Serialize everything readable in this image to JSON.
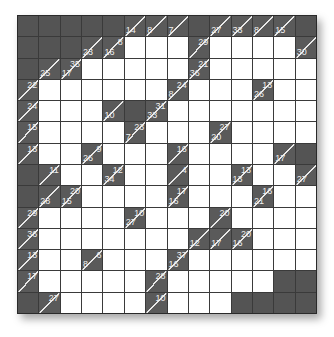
{
  "puzzle": {
    "type": "kakuro",
    "rows": 14,
    "cols": 14,
    "colors": {
      "clue_bg": "#5a5a5a",
      "black_bg": "#545454",
      "white_bg": "#ffffff",
      "grid_line": "#3a3a3a",
      "clue_text": "#f0f0f0"
    },
    "grid": [
      [
        "B",
        "B",
        "B",
        "B",
        "B",
        {
          "d": "14"
        },
        {
          "d": "8"
        },
        {
          "d": "7"
        },
        "B",
        {
          "d": "27"
        },
        {
          "d": "33"
        },
        {
          "d": "8"
        },
        {
          "d": "15"
        },
        "B"
      ],
      [
        "B",
        "B",
        "B",
        {
          "d": "23"
        },
        {
          "d": "16",
          "r": "8"
        },
        "W",
        "W",
        "W",
        {
          "r": "29"
        },
        "W",
        "W",
        "W",
        "W",
        {
          "d": "30"
        }
      ],
      [
        "B",
        {
          "d": "25"
        },
        {
          "d": "17",
          "r": "35"
        },
        "W",
        "W",
        "W",
        "W",
        "W",
        {
          "d": "36",
          "r": "21"
        },
        "W",
        "W",
        "W",
        "W",
        "W"
      ],
      [
        {
          "r": "22"
        },
        "W",
        "W",
        "W",
        "W",
        "W",
        "W",
        {
          "d": "8",
          "r": "24"
        },
        "W",
        "W",
        "W",
        {
          "d": "26",
          "r": "13"
        },
        "W",
        "W"
      ],
      [
        {
          "r": "24"
        },
        "W",
        "W",
        "W",
        {
          "d": "10"
        },
        "B",
        {
          "d": "33",
          "r": "31"
        },
        "W",
        "W",
        "W",
        "W",
        "W",
        "W",
        "W"
      ],
      [
        {
          "r": "15"
        },
        "W",
        "W",
        "W",
        "W",
        {
          "d": "7",
          "r": "23"
        },
        "W",
        "W",
        "W",
        {
          "d": "20",
          "r": "27"
        },
        "W",
        "W",
        "W",
        "W"
      ],
      [
        {
          "r": "13"
        },
        "W",
        "W",
        {
          "d": "26",
          "r": "9"
        },
        "W",
        "W",
        "W",
        {
          "r": "16"
        },
        "W",
        "W",
        "W",
        "W",
        {
          "d": "17"
        },
        "B"
      ],
      [
        "B",
        {
          "r": "11"
        },
        "W",
        "W",
        {
          "d": "34",
          "r": "12"
        },
        "W",
        "W",
        {
          "r": "4"
        },
        "W",
        "W",
        {
          "d": "13",
          "r": "13"
        },
        "W",
        "W",
        {
          "d": "27"
        }
      ],
      [
        "B",
        {
          "d": "28"
        },
        {
          "d": "15",
          "r": "20"
        },
        "W",
        "W",
        "W",
        "W",
        {
          "d": "16",
          "r": "17"
        },
        "W",
        "W",
        "W",
        {
          "d": "21",
          "r": "16"
        },
        "W",
        "W"
      ],
      [
        {
          "r": "29"
        },
        "W",
        "W",
        "W",
        "W",
        {
          "d": "27",
          "r": "10"
        },
        "W",
        "W",
        "W",
        {
          "r": "20"
        },
        "W",
        "W",
        "W",
        "W"
      ],
      [
        {
          "r": "36"
        },
        "W",
        "W",
        "W",
        "W",
        "W",
        "W",
        "W",
        {
          "d": "12"
        },
        {
          "d": "17"
        },
        {
          "d": "16",
          "r": "20"
        },
        "W",
        "W",
        "W"
      ],
      [
        {
          "r": "13"
        },
        "W",
        "W",
        {
          "d": "8",
          "r": "6"
        },
        "W",
        "W",
        "W",
        {
          "d": "16",
          "r": "37"
        },
        "W",
        "W",
        "W",
        "W",
        "W",
        "W"
      ],
      [
        {
          "r": "17"
        },
        "W",
        "W",
        "W",
        "W",
        "W",
        {
          "r": "28"
        },
        "W",
        "W",
        "W",
        "W",
        "W",
        "B",
        "B"
      ],
      [
        "B",
        {
          "r": "27"
        },
        "W",
        "W",
        "W",
        "W",
        {
          "r": "10"
        },
        "W",
        "W",
        "W",
        "B",
        "B",
        "B",
        "B"
      ]
    ]
  }
}
